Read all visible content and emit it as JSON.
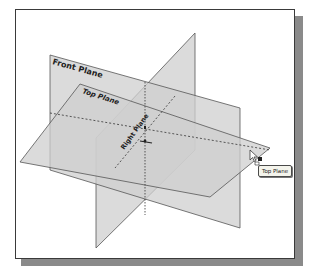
{
  "viewport": {
    "planes": [
      {
        "name": "front",
        "label": "Front Plane"
      },
      {
        "name": "top",
        "label": "Top Plane"
      },
      {
        "name": "right",
        "label": "Right Plane"
      }
    ],
    "tooltip": "Top Plane",
    "cursor": "arrow-with-plane-select"
  },
  "colors": {
    "plane_fill": "#cfcfcf",
    "plane_edge": "#555555",
    "frame_border": "#3a3a3a",
    "frame_shadow": "#8a8a8a",
    "background": "#ffffff"
  }
}
